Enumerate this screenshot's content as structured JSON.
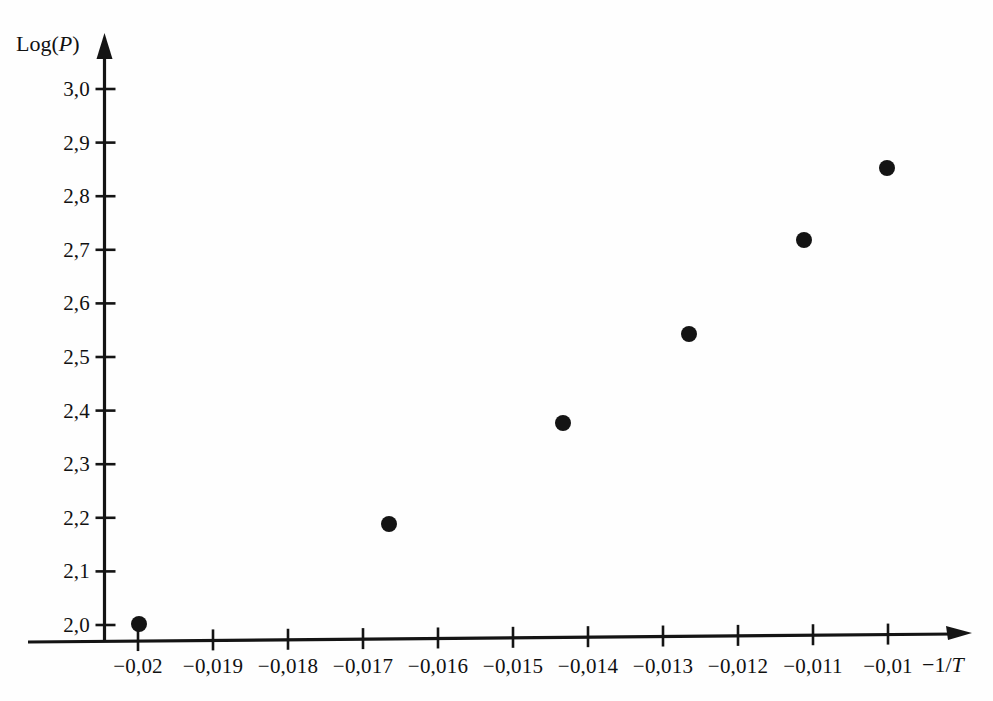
{
  "figure": {
    "background_color": "#fefefe",
    "ink_color": "#141414"
  },
  "axes": {
    "y_axis_title": "Log(P)",
    "y_axis_title_base": "Log(",
    "y_axis_title_var": "P",
    "y_axis_title_close": ")",
    "x_axis_title": "−1/T",
    "x_axis_title_base": "−1/",
    "x_axis_title_var": "T"
  },
  "chart_data": {
    "type": "scatter",
    "title": "",
    "subtitle": "",
    "xlabel": "−1/T",
    "ylabel": "Log(P)",
    "decimal_separator": ",",
    "grid": false,
    "legend": null,
    "xlim": [
      -0.0205,
      -0.0094
    ],
    "ylim": [
      1.98,
      3.02
    ],
    "x_ticks": [
      -0.02,
      -0.019,
      -0.018,
      -0.017,
      -0.016,
      -0.015,
      -0.014,
      -0.013,
      -0.012,
      -0.011,
      -0.01
    ],
    "x_tick_labels": [
      "−0,02",
      "−0,019",
      "−0,018",
      "−0,017",
      "−0,016",
      "−0,015",
      "−0,014",
      "−0,013",
      "−0,012",
      "−0,011",
      "−0,01"
    ],
    "y_ticks": [
      2.0,
      2.1,
      2.2,
      2.3,
      2.4,
      2.5,
      2.6,
      2.7,
      2.8,
      2.9,
      3.0
    ],
    "y_tick_labels": [
      "2,0",
      "2,1",
      "2,2",
      "2,3",
      "2,4",
      "2,5",
      "2,6",
      "2,7",
      "2,8",
      "2,9",
      "3,0"
    ],
    "series": [
      {
        "name": "measured points",
        "marker": "filled-circle",
        "marker_color": "#141414",
        "marker_radius_px": 8,
        "x": [
          -0.02,
          -0.0164,
          -0.0141,
          -0.0125,
          -0.0111,
          -0.0098
        ],
        "y": [
          1.98,
          2.17,
          2.37,
          2.54,
          2.72,
          2.86
        ],
        "point_labels": [
          "(−0,02; 1,98)",
          "(−0,0164; 2,17)",
          "(−0,0141; 2,37)",
          "(−0,0125; 2,54)",
          "(−0,0111; 2,72)",
          "(−0,0098; 2,86)"
        ]
      }
    ]
  },
  "geometry": {
    "x_axis_y_px": 639,
    "y_axis_x_px": 104.5,
    "x_tick_px": [
      138,
      213,
      288,
      363,
      438,
      513,
      588,
      663,
      738,
      813,
      888
    ],
    "y_tick_px": [
      625,
      571.4,
      517.8,
      464.2,
      410.6,
      357,
      303.4,
      249.8,
      196.2,
      142.6,
      89
    ],
    "x_arrow_tip_px": 972,
    "y_arrow_tip_px": 33,
    "point_px": [
      {
        "cx": 139,
        "cy": 624
      },
      {
        "cx": 389,
        "cy": 524
      },
      {
        "cx": 563,
        "cy": 423
      },
      {
        "cx": 689,
        "cy": 334
      },
      {
        "cx": 804,
        "cy": 240
      },
      {
        "cx": 887,
        "cy": 168
      }
    ]
  }
}
